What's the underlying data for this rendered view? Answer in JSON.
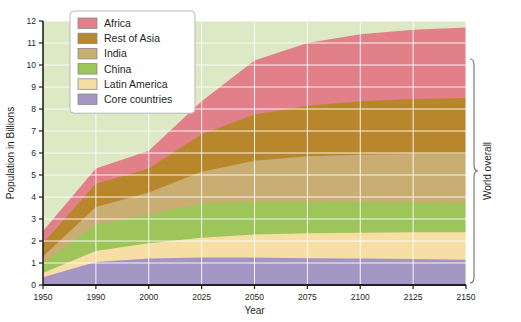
{
  "chart_data": {
    "type": "area",
    "stacked": true,
    "title": "",
    "xlabel": "Year",
    "ylabel": "Population in Billions",
    "ylim": [
      0,
      12
    ],
    "ytick_labels": [
      "0",
      "1",
      "2",
      "3",
      "4",
      "5",
      "6",
      "7",
      "8",
      "9",
      "10",
      "11",
      "12"
    ],
    "xtick_labels": [
      "1950",
      "1990",
      "2000",
      "2025",
      "2050",
      "2075",
      "2100",
      "2125",
      "2150"
    ],
    "x": [
      1950,
      1990,
      2000,
      2025,
      2050,
      2075,
      2100,
      2125,
      2150
    ],
    "grid": true,
    "legend_position": "top-left",
    "annotation_right": "World overall",
    "plot_background": "#dde8c4",
    "grid_color": "#ffffff",
    "series": [
      {
        "name": "Core countries",
        "color": "#a396c4",
        "values": [
          0.35,
          1.05,
          1.2,
          1.25,
          1.25,
          1.22,
          1.2,
          1.18,
          1.15
        ]
      },
      {
        "name": "Latin America",
        "color": "#f7dea4",
        "values": [
          0.55,
          1.55,
          1.9,
          2.15,
          2.3,
          2.35,
          2.38,
          2.4,
          2.4
        ]
      },
      {
        "name": "China",
        "color": "#9dc559",
        "values": [
          1.0,
          2.75,
          3.2,
          3.7,
          3.8,
          3.8,
          3.78,
          3.75,
          3.72
        ]
      },
      {
        "name": "India",
        "color": "#c9ad72",
        "values": [
          1.3,
          3.55,
          4.2,
          5.15,
          5.65,
          5.85,
          5.92,
          5.95,
          5.95
        ]
      },
      {
        "name": "Rest of Asia",
        "color": "#b8862b",
        "values": [
          1.9,
          4.6,
          5.3,
          6.85,
          7.75,
          8.15,
          8.35,
          8.45,
          8.5
        ]
      },
      {
        "name": "Africa",
        "color": "#e2808a",
        "values": [
          2.45,
          5.3,
          6.1,
          8.35,
          10.2,
          11.0,
          11.4,
          11.6,
          11.7
        ]
      }
    ]
  },
  "legend": {
    "items": [
      {
        "label": "Africa",
        "color": "#e2808a"
      },
      {
        "label": "Rest of Asia",
        "color": "#b8862b"
      },
      {
        "label": "India",
        "color": "#c9ad72"
      },
      {
        "label": "China",
        "color": "#9dc559"
      },
      {
        "label": "Latin America",
        "color": "#f7dea4"
      },
      {
        "label": "Core countries",
        "color": "#a396c4"
      }
    ]
  }
}
